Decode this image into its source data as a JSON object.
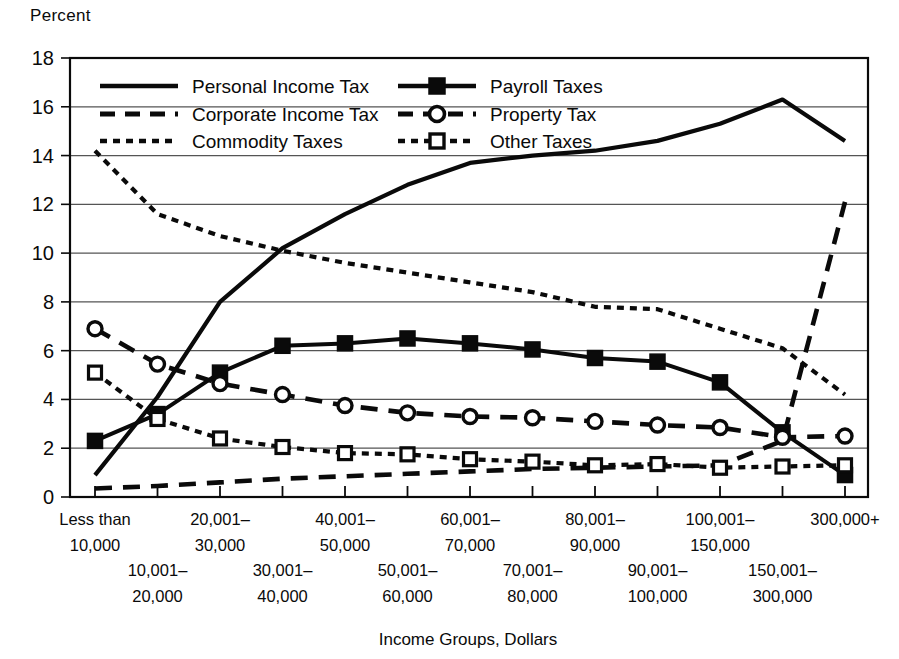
{
  "chart_data": {
    "type": "line",
    "title": "",
    "ylabel": "Percent",
    "xlabel": "Income Groups, Dollars",
    "ylim": [
      0,
      18
    ],
    "yticks": [
      0,
      2,
      4,
      6,
      8,
      10,
      12,
      14,
      16,
      18
    ],
    "grid": true,
    "legend_position": "top-inside",
    "categories": [
      "Less than 10,000",
      "10,001-20,000",
      "20,001-30,000",
      "30,001-40,000",
      "40,001-50,000",
      "50,001-60,000",
      "60,001-70,000",
      "70,001-80,000",
      "80,001-90,000",
      "90,001-100,000",
      "100,001-150,000",
      "150,001-300,000",
      "300,000+"
    ],
    "category_labels_upper": [
      {
        "line1": "Less than",
        "line2": "10,000"
      },
      {
        "line1": "20,001–",
        "line2": "30,000"
      },
      {
        "line1": "40,001–",
        "line2": "50,000"
      },
      {
        "line1": "60,001–",
        "line2": "70,000"
      },
      {
        "line1": "80,001–",
        "line2": "90,000"
      },
      {
        "line1": "100,001–",
        "line2": "150,000"
      },
      {
        "line1": "300,000+",
        "line2": ""
      }
    ],
    "category_labels_lower": [
      {
        "line1": "10,001–",
        "line2": "20,000"
      },
      {
        "line1": "30,001–",
        "line2": "40,000"
      },
      {
        "line1": "50,001–",
        "line2": "60,000"
      },
      {
        "line1": "70,001–",
        "line2": "80,000"
      },
      {
        "line1": "90,001–",
        "line2": "100,000"
      },
      {
        "line1": "150,001–",
        "line2": "300,000"
      }
    ],
    "series": [
      {
        "name": "Personal Income Tax",
        "style": "solid",
        "marker": "none",
        "values": [
          0.9,
          4.1,
          8.0,
          10.2,
          11.6,
          12.8,
          13.7,
          14.0,
          14.2,
          14.6,
          15.3,
          16.3,
          14.6
        ]
      },
      {
        "name": "Payroll Taxes",
        "style": "solid",
        "marker": "filled-square",
        "values": [
          2.3,
          3.4,
          5.1,
          6.2,
          6.3,
          6.5,
          6.3,
          6.05,
          5.7,
          5.55,
          4.7,
          2.65,
          0.9
        ]
      },
      {
        "name": "Corporate Income Tax",
        "style": "long-dash",
        "marker": "none",
        "values": [
          0.35,
          0.45,
          0.6,
          0.75,
          0.85,
          0.95,
          1.05,
          1.15,
          1.2,
          1.25,
          1.3,
          2.3,
          12.1
        ]
      },
      {
        "name": "Property Tax",
        "style": "long-dash",
        "marker": "open-circle",
        "values": [
          6.9,
          5.45,
          4.65,
          4.2,
          3.75,
          3.45,
          3.3,
          3.25,
          3.1,
          2.95,
          2.85,
          2.45,
          2.5
        ]
      },
      {
        "name": "Commodity Taxes",
        "style": "short-dash",
        "marker": "none",
        "values": [
          14.2,
          11.6,
          10.7,
          10.1,
          9.6,
          9.2,
          8.8,
          8.4,
          7.8,
          7.7,
          6.9,
          6.1,
          4.2
        ]
      },
      {
        "name": "Other Taxes",
        "style": "short-dash",
        "marker": "open-square",
        "values": [
          5.1,
          3.2,
          2.4,
          2.05,
          1.8,
          1.75,
          1.55,
          1.45,
          1.3,
          1.35,
          1.2,
          1.25,
          1.3
        ]
      }
    ]
  },
  "legend": {
    "entries": [
      {
        "label": "Personal Income Tax",
        "style": "solid",
        "marker": "none"
      },
      {
        "label": "Payroll Taxes",
        "style": "solid",
        "marker": "filled-square"
      },
      {
        "label": "Corporate Income Tax",
        "style": "long-dash",
        "marker": "none"
      },
      {
        "label": "Property Tax",
        "style": "long-dash",
        "marker": "open-circle"
      },
      {
        "label": "Commodity Taxes",
        "style": "short-dash",
        "marker": "none"
      },
      {
        "label": "Other Taxes",
        "style": "short-dash",
        "marker": "open-square"
      }
    ]
  },
  "colors": {
    "ink": "#0a0a0a",
    "grid": "#555555",
    "background": "#ffffff"
  }
}
